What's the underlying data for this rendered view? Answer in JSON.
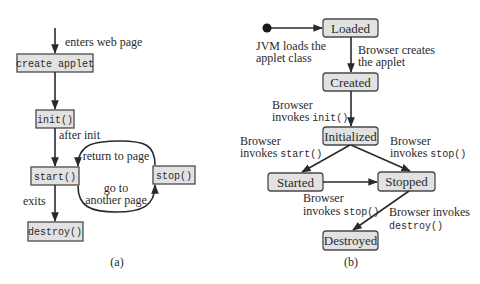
{
  "panel_a": {
    "caption": "(a)",
    "boxes": {
      "create": "create applet",
      "init": "init()",
      "start": "start()",
      "stop": "stop()",
      "destroy": "destroy()"
    },
    "labels": {
      "enters": "enters web page",
      "after_init": "after init",
      "return_to_page": "return to page",
      "go_to_1": "go to",
      "go_to_2": "another page",
      "exits": "exits"
    }
  },
  "panel_b": {
    "caption": "(b)",
    "states": {
      "loaded": "Loaded",
      "created": "Created",
      "initialized": "Initialized",
      "started": "Started",
      "stopped": "Stopped",
      "destroyed": "Destroyed"
    },
    "transitions": {
      "jvm_1": "JVM loads the",
      "jvm_2": "applet class",
      "creates_1": "Browser creates",
      "creates_2": "the applet",
      "init_1": "Browser",
      "init_2a": "invokes ",
      "init_2b": "init()",
      "start_1": "Browser",
      "start_2a": "invokes ",
      "start_2b": "start()",
      "stop_1": "Browser",
      "stop_2a": "invokes ",
      "stop_2b": "stop()",
      "stop2_1": "Browser",
      "stop2_2a": "invokes ",
      "stop2_2b": "stop()",
      "destroy_1": "Browser invokes",
      "destroy_2": "destroy()"
    }
  }
}
